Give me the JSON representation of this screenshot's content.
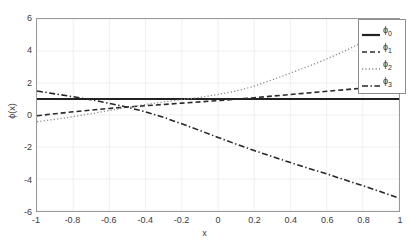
{
  "chart_data": {
    "type": "line",
    "title": "",
    "xlabel": "x",
    "ylabel": "ϕ(x)",
    "xlim": [
      -1,
      1
    ],
    "ylim": [
      -6,
      6
    ],
    "xticks": [
      "-1",
      "-0.8",
      "-0.6",
      "-0.4",
      "-0.2",
      "0",
      "0.2",
      "0.4",
      "0.6",
      "0.8",
      "1"
    ],
    "xtick_values": [
      -1,
      -0.8,
      -0.6,
      -0.4,
      -0.2,
      0,
      0.2,
      0.4,
      0.6,
      0.8,
      1
    ],
    "yticks": [
      "6",
      "4",
      "2",
      "0",
      "-2",
      "-4",
      "-6"
    ],
    "ytick_values": [
      6,
      4,
      2,
      0,
      -2,
      -4,
      -6
    ],
    "grid": true,
    "legend_position": "top-right",
    "x": [
      -1,
      -0.9,
      -0.8,
      -0.7,
      -0.6,
      -0.5,
      -0.4,
      -0.3,
      -0.2,
      -0.1,
      0,
      0.1,
      0.2,
      0.3,
      0.4,
      0.5,
      0.6,
      0.7,
      0.8,
      0.9,
      1
    ],
    "series": [
      {
        "name": "ϕ₀",
        "label": "ϕ",
        "sub": "0",
        "style": "solid",
        "color": "#222222",
        "width": 2.2,
        "values": [
          1,
          1,
          1,
          1,
          1,
          1,
          1,
          1,
          1,
          1,
          1,
          1,
          1,
          1,
          1,
          1,
          1,
          1,
          1,
          1,
          1
        ]
      },
      {
        "name": "ϕ₁",
        "label": "ϕ",
        "sub": "1",
        "style": "dashed",
        "color": "#2a2a2a",
        "width": 1.6,
        "values": [
          -0.05,
          0.08,
          0.2,
          0.31,
          0.41,
          0.5,
          0.58,
          0.66,
          0.74,
          0.82,
          0.9,
          0.99,
          1.08,
          1.18,
          1.28,
          1.38,
          1.48,
          1.58,
          1.68,
          1.79,
          1.9
        ]
      },
      {
        "name": "ϕ₂",
        "label": "ϕ",
        "sub": "2",
        "style": "dotted",
        "color": "#8a8a8a",
        "width": 1.3,
        "values": [
          -0.42,
          -0.27,
          -0.1,
          0.08,
          0.28,
          0.48,
          0.66,
          0.82,
          0.96,
          1.1,
          1.28,
          1.5,
          1.8,
          2.2,
          2.62,
          3.05,
          3.5,
          4.0,
          4.55,
          5.2,
          5.95
        ]
      },
      {
        "name": "ϕ₃",
        "label": "ϕ",
        "sub": "3",
        "style": "dashdot",
        "color": "#262626",
        "width": 1.6,
        "values": [
          1.5,
          1.32,
          1.14,
          0.95,
          0.73,
          0.48,
          0.2,
          -0.15,
          -0.55,
          -0.97,
          -1.4,
          -1.82,
          -2.22,
          -2.6,
          -2.97,
          -3.33,
          -3.68,
          -4.05,
          -4.42,
          -4.8,
          -5.2
        ]
      }
    ]
  },
  "axes": {
    "xlabel": "x",
    "ylabel": "ϕ(x)"
  }
}
